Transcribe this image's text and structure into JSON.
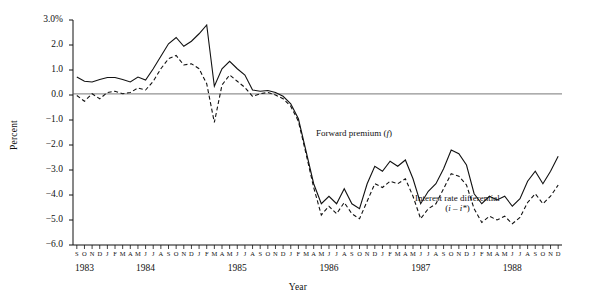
{
  "figure": {
    "ylabel": "Percent",
    "xlabel": "Year",
    "annotations": {
      "forward": "Forward premium (f)",
      "differential_line1": "Interest rate differential",
      "differential_line2": "(i – i*)"
    }
  },
  "chart_data": {
    "type": "line",
    "title": "",
    "xlabel": "Year",
    "ylabel": "Percent",
    "ylim": [
      -6.0,
      3.0
    ],
    "ytick_labels": [
      "3.0%",
      "2.0",
      "1.0",
      "0.0",
      "−1.0",
      "−2.0",
      "−3.0",
      "−4.0",
      "−5.0",
      "−6.0"
    ],
    "ytick_values": [
      3.0,
      2.0,
      1.0,
      0.0,
      -1.0,
      -2.0,
      -3.0,
      -4.0,
      -5.0,
      -6.0
    ],
    "grid": false,
    "zero_line": true,
    "legend_position": "inline-annotation",
    "month_initials": [
      "S",
      "O",
      "N",
      "D",
      "J",
      "F",
      "M",
      "A",
      "M",
      "J",
      "J",
      "A",
      "S",
      "O",
      "N",
      "D",
      "J",
      "F",
      "M",
      "A",
      "M",
      "J",
      "J",
      "A",
      "S",
      "O",
      "N",
      "D",
      "J",
      "F",
      "M",
      "A",
      "M",
      "J",
      "J",
      "A",
      "S",
      "O",
      "N",
      "D",
      "J",
      "F",
      "M",
      "A",
      "M",
      "J",
      "J",
      "A",
      "S",
      "O",
      "N",
      "D",
      "J",
      "F",
      "M",
      "A",
      "M",
      "J",
      "J",
      "A",
      "S",
      "O",
      "N",
      "D"
    ],
    "year_labels": [
      "1983",
      "1984",
      "1985",
      "1986",
      "1987",
      "1988"
    ],
    "year_label_index": [
      1,
      9,
      21,
      33,
      45,
      57
    ],
    "x_start": "1983-09",
    "x_end": "1988-12",
    "series": [
      {
        "name": "Forward premium (f)",
        "style": "solid",
        "color": "#111111",
        "values": [
          0.72,
          0.55,
          0.52,
          0.62,
          0.7,
          0.7,
          0.62,
          0.52,
          0.72,
          0.6,
          1.05,
          1.55,
          2.05,
          2.3,
          1.95,
          2.15,
          2.45,
          2.8,
          0.35,
          1.05,
          1.35,
          1.05,
          0.8,
          0.2,
          0.15,
          0.18,
          0.1,
          -0.05,
          -0.35,
          -0.95,
          -2.25,
          -3.55,
          -4.35,
          -4.05,
          -4.35,
          -3.75,
          -4.35,
          -4.55,
          -3.55,
          -2.85,
          -3.05,
          -2.65,
          -2.85,
          -2.6,
          -3.35,
          -4.35,
          -3.85,
          -3.55,
          -2.95,
          -2.2,
          -2.35,
          -2.8,
          -3.95,
          -4.35,
          -4.05,
          -4.2,
          -4.05,
          -4.45,
          -4.15,
          -3.45,
          -3.05,
          -3.55,
          -3.05,
          -2.45
        ]
      },
      {
        "name": "Interest rate differential (i - i*)",
        "style": "dashed",
        "color": "#111111",
        "values": [
          -0.02,
          -0.25,
          0.05,
          -0.15,
          0.1,
          0.15,
          0.05,
          0.1,
          0.28,
          0.2,
          0.55,
          1.05,
          1.45,
          1.58,
          1.2,
          1.25,
          1.05,
          0.45,
          -1.1,
          0.4,
          0.8,
          0.55,
          0.3,
          -0.05,
          0.05,
          0.1,
          0.0,
          -0.15,
          -0.45,
          -1.05,
          -2.35,
          -3.7,
          -4.8,
          -4.45,
          -4.75,
          -4.3,
          -4.75,
          -4.95,
          -4.25,
          -3.55,
          -3.7,
          -3.45,
          -3.55,
          -3.35,
          -4.05,
          -4.95,
          -4.55,
          -4.35,
          -3.75,
          -3.15,
          -3.25,
          -3.6,
          -4.55,
          -5.1,
          -4.85,
          -5.0,
          -4.85,
          -5.15,
          -4.9,
          -4.3,
          -3.95,
          -4.35,
          -4.05,
          -3.6
        ]
      }
    ],
    "annotations": [
      {
        "text": "Forward premium (f)",
        "series": "Forward premium (f)"
      },
      {
        "text": "Interest rate differential (i – i*)",
        "series": "Interest rate differential (i - i*)"
      }
    ]
  }
}
